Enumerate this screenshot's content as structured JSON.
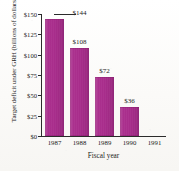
{
  "chart_data": {
    "type": "bar",
    "title": "",
    "xlabel": "Fiscal year",
    "ylabel": "Target deficit under GRH (billions of dollars)",
    "categories": [
      "1987",
      "1988",
      "1989",
      "1990",
      "1991"
    ],
    "values": [
      144,
      108,
      72,
      36,
      0
    ],
    "value_labels": [
      "$144",
      "$108",
      "$72",
      "$36",
      ""
    ],
    "ylim": [
      0,
      150
    ],
    "ytick_values": [
      0,
      25,
      50,
      75,
      100,
      125,
      150
    ],
    "ytick_labels": [
      "$0",
      "$25",
      "$50",
      "$75",
      "$100",
      "$125",
      "$150"
    ],
    "grid": false,
    "legend": "none",
    "bar_color": "#A92D8C",
    "axis_color": "#2b2b2b",
    "background_color": "#fdfdfb"
  }
}
